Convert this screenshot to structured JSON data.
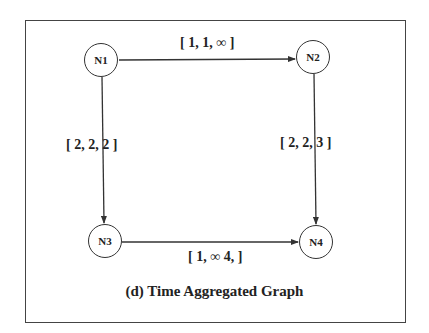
{
  "figure": {
    "caption": "(d) Time Aggregated Graph",
    "nodes": [
      {
        "id": "N1",
        "label": "N1"
      },
      {
        "id": "N2",
        "label": "N2"
      },
      {
        "id": "N3",
        "label": "N3"
      },
      {
        "id": "N4",
        "label": "N4"
      }
    ],
    "edges": [
      {
        "from": "N1",
        "to": "N2",
        "label": "[ 1, 1, ∞ ]"
      },
      {
        "from": "N1",
        "to": "N3",
        "label": "[ 2,  2,  2 ]"
      },
      {
        "from": "N2",
        "to": "N4",
        "label": "[ 2, 2,  3 ]"
      },
      {
        "from": "N3",
        "to": "N4",
        "label": "[ 1, ∞ 4, ]"
      }
    ]
  }
}
